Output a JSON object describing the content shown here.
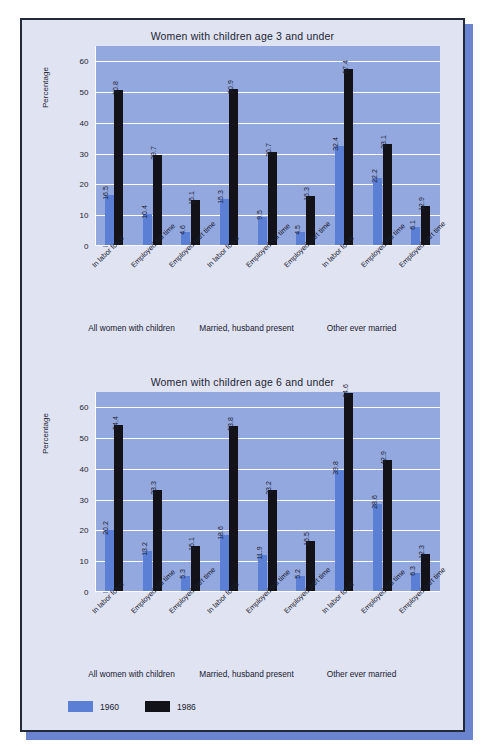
{
  "legend": {
    "items": [
      {
        "label": "1960",
        "color": "#5b7fd4",
        "name": "legend-swatch-1960"
      },
      {
        "label": "1986",
        "color": "#121218",
        "name": "legend-swatch-1986"
      }
    ]
  },
  "colors": {
    "series_1960": "#5b7fd4",
    "series_1986": "#121218",
    "plot_background": "#93a8de",
    "page_background": "#dfe3f2",
    "border": "#222a3c",
    "gridline": "#ffffff"
  },
  "chart_data": [
    {
      "type": "bar",
      "title": "Women with children age 3 and under",
      "xlabel": "",
      "ylabel": "Percentage",
      "ylim": [
        0,
        65
      ],
      "yticks": [
        0,
        10,
        20,
        30,
        40,
        50,
        60
      ],
      "ytick_labels": [
        "0",
        "10",
        "20",
        "30",
        "40",
        "50",
        "60"
      ],
      "grid": true,
      "legend_position": "bottom-left",
      "groups": [
        "All women with children",
        "Married, husband present",
        "Other ever married"
      ],
      "categories": [
        "In labor force",
        "Employed full time",
        "Employed part time",
        "In labor force",
        "Employed full time",
        "Employed part time",
        "In labor force",
        "Employed full time",
        "Employed part time"
      ],
      "series": [
        {
          "name": "1960",
          "values": [
            16.5,
            10.4,
            4.6,
            15.3,
            9.5,
            4.5,
            32.4,
            22.2,
            6.1
          ]
        },
        {
          "name": "1986",
          "values": [
            50.8,
            29.7,
            15.1,
            50.9,
            30.7,
            16.3,
            57.4,
            33.1,
            12.9
          ]
        }
      ]
    },
    {
      "type": "bar",
      "title": "Women with children age 6 and under",
      "xlabel": "",
      "ylabel": "Percentage",
      "ylim": [
        0,
        65
      ],
      "yticks": [
        0,
        10,
        20,
        30,
        40,
        50,
        60
      ],
      "ytick_labels": [
        "0",
        "10",
        "20",
        "30",
        "40",
        "50",
        "60"
      ],
      "grid": true,
      "legend_position": "bottom-left",
      "groups": [
        "All women with children",
        "Married, husband present",
        "Other ever married"
      ],
      "categories": [
        "In labor force",
        "Employed full time",
        "Employed part time",
        "In labor force",
        "Employed full time",
        "Employed part time",
        "In labor force",
        "Employed full time",
        "Employed part time"
      ],
      "series": [
        {
          "name": "1960",
          "values": [
            20.2,
            13.2,
            5.3,
            18.6,
            11.9,
            5.2,
            39.8,
            28.6,
            6.3
          ]
        },
        {
          "name": "1986",
          "values": [
            54.4,
            33.3,
            15.1,
            53.8,
            33.2,
            16.5,
            64.6,
            42.9,
            12.3
          ]
        }
      ]
    }
  ]
}
